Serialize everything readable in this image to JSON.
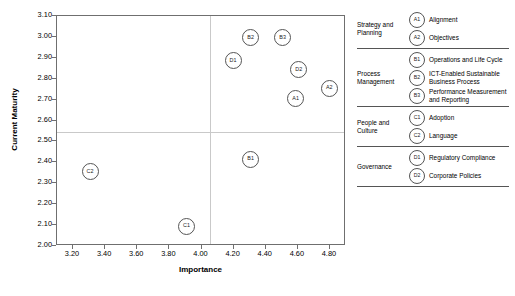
{
  "chart_data": {
    "type": "scatter",
    "title": "",
    "xlabel": "Importance",
    "ylabel": "Current Maturity",
    "xlim": [
      3.1,
      4.9
    ],
    "ylim": [
      2.0,
      3.1
    ],
    "xticks": [
      "3.20",
      "3.40",
      "3.60",
      "3.80",
      "4.00",
      "4.20",
      "4.40",
      "4.60",
      "4.80"
    ],
    "xtick_values": [
      3.2,
      3.4,
      3.6,
      3.8,
      4.0,
      4.2,
      4.4,
      4.6,
      4.8
    ],
    "yticks": [
      "2.00",
      "2.10",
      "2.20",
      "2.30",
      "2.40",
      "2.50",
      "2.60",
      "2.70",
      "2.80",
      "2.90",
      "3.00",
      "3.10"
    ],
    "ytick_values": [
      2.0,
      2.1,
      2.2,
      2.3,
      2.4,
      2.5,
      2.6,
      2.7,
      2.8,
      2.9,
      3.0,
      3.1
    ],
    "grid": false,
    "legend_position": "right",
    "reference_lines": {
      "x": 4.05,
      "y": 2.545
    },
    "points": [
      {
        "label": "A1",
        "x": 4.58,
        "y": 2.71
      },
      {
        "label": "A2",
        "x": 4.79,
        "y": 2.76
      },
      {
        "label": "B1",
        "x": 4.3,
        "y": 2.42
      },
      {
        "label": "B2",
        "x": 4.3,
        "y": 3.0
      },
      {
        "label": "B3",
        "x": 4.5,
        "y": 3.0
      },
      {
        "label": "C1",
        "x": 3.9,
        "y": 2.1
      },
      {
        "label": "C2",
        "x": 3.3,
        "y": 2.36
      },
      {
        "label": "D1",
        "x": 4.19,
        "y": 2.89
      },
      {
        "label": "D2",
        "x": 4.6,
        "y": 2.85
      }
    ]
  },
  "legend": {
    "groups": [
      {
        "name": "Strategy and Planning",
        "items": [
          {
            "code": "A1",
            "label": "Alignment"
          },
          {
            "code": "A2",
            "label": "Objectives"
          }
        ]
      },
      {
        "name": "Process Management",
        "items": [
          {
            "code": "B1",
            "label": "Operations and Life Cycle"
          },
          {
            "code": "B2",
            "label": "ICT-Enabled Sustainable Business Process"
          },
          {
            "code": "B3",
            "label": "Performance Measurement and Reporting"
          }
        ]
      },
      {
        "name": "People and Culture",
        "items": [
          {
            "code": "C1",
            "label": "Adoption"
          },
          {
            "code": "C2",
            "label": "Language"
          }
        ]
      },
      {
        "name": "Governance",
        "items": [
          {
            "code": "D1",
            "label": "Regulatory Compliance"
          },
          {
            "code": "D2",
            "label": "Corporate Policies"
          }
        ]
      }
    ]
  }
}
